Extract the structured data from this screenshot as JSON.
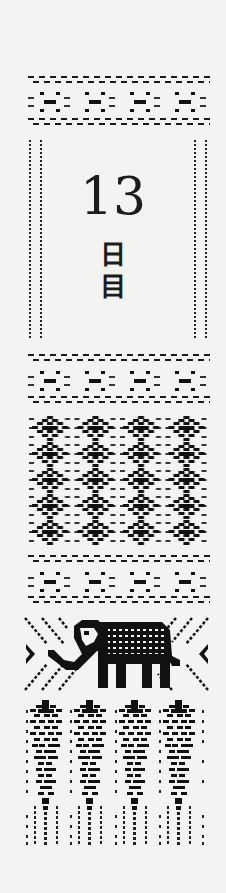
{
  "banner": {
    "day_number": "13",
    "day_suffix_chars": [
      "日",
      "目"
    ],
    "day_label": "13日目",
    "colors": {
      "ink": "#111111",
      "paper": "#f3f3f1"
    }
  },
  "sections": [
    {
      "name": "top-cross-band",
      "motif": "cross",
      "count": 4
    },
    {
      "name": "title-frame",
      "motif": "dotted-double-border"
    },
    {
      "name": "middle-cross-band",
      "motif": "cross",
      "count": 4
    },
    {
      "name": "diamond-weave-block",
      "motif": "diamond",
      "columns": 4,
      "rows": 5
    },
    {
      "name": "lower-cross-band",
      "motif": "cross",
      "count": 4
    },
    {
      "name": "elephant-panel",
      "motif": "elephant"
    },
    {
      "name": "tree-fringe-block",
      "motif": "tree",
      "count": 4
    }
  ]
}
